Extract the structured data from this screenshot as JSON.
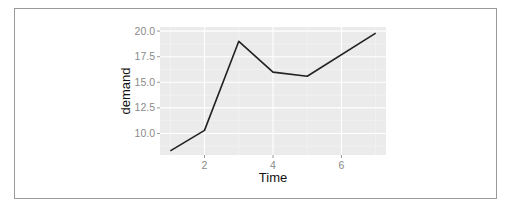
{
  "chart_data": {
    "type": "line",
    "title": "",
    "xlabel": "Time",
    "ylabel": "demand",
    "x": [
      1,
      2,
      3,
      4,
      5,
      7
    ],
    "series": [
      {
        "name": "demand",
        "values": [
          8.3,
          10.3,
          19.0,
          16.0,
          15.6,
          19.8
        ],
        "color": "#222222"
      }
    ],
    "xlim": [
      0.7,
      7.3
    ],
    "ylim": [
      7.9,
      20.4
    ],
    "x_ticks": [
      2,
      4,
      6
    ],
    "x_tick_labels": [
      "2",
      "4",
      "6"
    ],
    "y_ticks": [
      10.0,
      12.5,
      15.0,
      17.5,
      20.0
    ],
    "y_tick_labels": [
      "10.0",
      "12.5",
      "15.0",
      "17.5",
      "20.0"
    ],
    "grid": true,
    "panel_background": "#ebebeb",
    "grid_color": "#ffffff",
    "legend": "none"
  }
}
